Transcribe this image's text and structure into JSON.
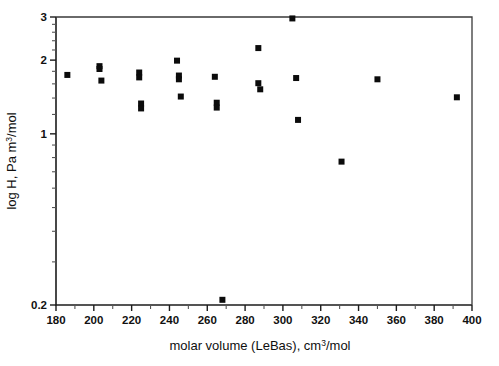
{
  "chart_data": {
    "type": "scatter",
    "title": "",
    "xlabel": "molar volume (LeBas), cm³/mol",
    "ylabel": "log H, Pa m³/mol",
    "xlabel_parts": {
      "pre": "molar volume (LeBas), cm",
      "sup": "3",
      "post": "/mol"
    },
    "ylabel_parts": {
      "pre": "log H, Pa m",
      "sup": "3",
      "post": "/mol"
    },
    "xlim": [
      180,
      400
    ],
    "ylim": [
      0.2,
      3
    ],
    "yscale": "log",
    "xscale": "linear",
    "grid": false,
    "legend": null,
    "xticks": [
      180,
      200,
      220,
      240,
      260,
      280,
      300,
      320,
      340,
      360,
      380,
      400
    ],
    "xtick_labels": [
      "180",
      "200",
      "220",
      "240",
      "260",
      "280",
      "300",
      "320",
      "340",
      "360",
      "380",
      "400"
    ],
    "xminor_step": 10,
    "yticks": [
      0.2,
      1,
      2,
      3
    ],
    "ytick_labels": [
      "0.2",
      "1",
      "2",
      "3"
    ],
    "yminor_ticks": [
      0.3,
      0.4,
      0.5,
      0.6,
      0.7,
      0.8,
      0.9,
      1.2,
      1.4,
      1.6,
      1.8,
      2.2,
      2.4,
      2.6,
      2.8
    ],
    "marker": {
      "shape": "square",
      "color": "#0b0b0b",
      "size_px": 6
    },
    "points": [
      {
        "x": 186,
        "y": 1.74
      },
      {
        "x": 203,
        "y": 1.89
      },
      {
        "x": 203,
        "y": 1.84
      },
      {
        "x": 204,
        "y": 1.65
      },
      {
        "x": 224,
        "y": 1.78
      },
      {
        "x": 224,
        "y": 1.7
      },
      {
        "x": 225,
        "y": 1.33
      },
      {
        "x": 225,
        "y": 1.27
      },
      {
        "x": 244,
        "y": 1.99
      },
      {
        "x": 245,
        "y": 1.73
      },
      {
        "x": 245,
        "y": 1.67
      },
      {
        "x": 246,
        "y": 1.42
      },
      {
        "x": 264,
        "y": 1.71
      },
      {
        "x": 265,
        "y": 1.34
      },
      {
        "x": 265,
        "y": 1.28
      },
      {
        "x": 268,
        "y": 0.21
      },
      {
        "x": 287,
        "y": 2.24
      },
      {
        "x": 287,
        "y": 1.61
      },
      {
        "x": 288,
        "y": 1.52
      },
      {
        "x": 305,
        "y": 2.96
      },
      {
        "x": 307,
        "y": 1.69
      },
      {
        "x": 308,
        "y": 1.14
      },
      {
        "x": 331,
        "y": 0.77
      },
      {
        "x": 350,
        "y": 1.67
      },
      {
        "x": 392,
        "y": 1.41
      }
    ]
  },
  "layout": {
    "plot_left_px": 56,
    "plot_right_px": 472,
    "plot_top_px": 17,
    "plot_bottom_px": 305,
    "background": "#ffffff",
    "axis_color": "#1c1c1c",
    "marker_color": "#0b0b0b"
  }
}
